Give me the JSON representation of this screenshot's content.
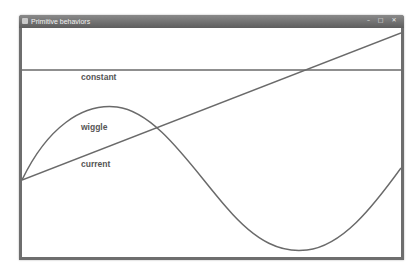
{
  "window": {
    "title": "Primitive behaviors",
    "controls": {
      "minimize": "–",
      "maximize": "□",
      "close": "✕"
    }
  },
  "labels": {
    "constant": "constant",
    "wiggle": "wiggle",
    "current": "current"
  },
  "colors": {
    "line": "#6a6a6a",
    "frame": "#6e6e6e",
    "background": "#ffffff"
  }
}
